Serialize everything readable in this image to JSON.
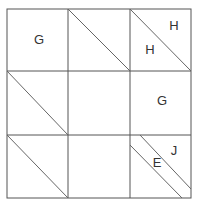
{
  "diagram": {
    "grid": {
      "rows": 3,
      "cols": 3,
      "line_color": "#555555",
      "diagonal_color": "#666666"
    },
    "cells": [
      {
        "row": 0,
        "col": 0,
        "labels": [
          "G"
        ],
        "diagonals": 0
      },
      {
        "row": 0,
        "col": 1,
        "labels": [],
        "diagonals": 1
      },
      {
        "row": 0,
        "col": 2,
        "labels": [
          "H",
          "H"
        ],
        "diagonals": 1
      },
      {
        "row": 1,
        "col": 0,
        "labels": [],
        "diagonals": 1
      },
      {
        "row": 1,
        "col": 1,
        "labels": [],
        "diagonals": 0
      },
      {
        "row": 1,
        "col": 2,
        "labels": [
          "G"
        ],
        "diagonals": 0
      },
      {
        "row": 2,
        "col": 0,
        "labels": [],
        "diagonals": 1
      },
      {
        "row": 2,
        "col": 1,
        "labels": [],
        "diagonals": 0
      },
      {
        "row": 2,
        "col": 2,
        "labels": [
          "J",
          "E"
        ],
        "diagonals": 2
      }
    ],
    "labels": {
      "r0c0": "G",
      "r0c2_upper": "H",
      "r0c2_lower": "H",
      "r1c2": "G",
      "r2c2_upper": "J",
      "r2c2_band": "E"
    }
  }
}
